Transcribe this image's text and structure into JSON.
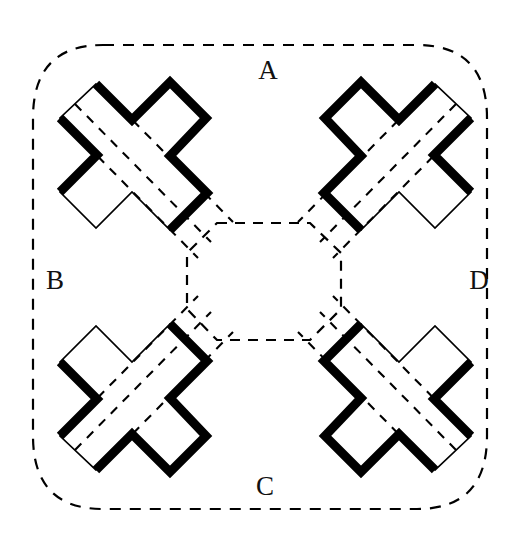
{
  "figure": {
    "background_color": "#ffffff",
    "ink_color": "#000000",
    "thick_stroke_width": 9,
    "thin_stroke_width": 1.6,
    "dashed_stroke_width": 2.0,
    "dash_pattern": "9 8",
    "canvas": {
      "width": 531,
      "height": 554
    }
  },
  "labels": [
    {
      "id": "label-a",
      "text": "A",
      "x": 268,
      "y": 72
    },
    {
      "id": "label-b",
      "text": "B",
      "x": 54,
      "y": 283
    },
    {
      "id": "label-c",
      "text": "C",
      "x": 265,
      "y": 489
    },
    {
      "id": "label-d",
      "text": "D",
      "x": 479,
      "y": 283
    }
  ],
  "geometry": {
    "outer_boundary": {
      "name": "dashed-rounded-square-boundary",
      "path": "M 100 44 L 420 44 Q 487 44 487 116 L 487 438 Q 487 510 420 510 L 100 510 Q 33 510 33 438 L 33 116 Q 33 44 100 44 Z",
      "style": "dashed"
    },
    "center_octagon": {
      "name": "dashed-center-octagon",
      "path": "M 218 222 L 310 222 L 340 252 L 340 310 L 310 340 L 218 340 L 188 310 L 188 252 Z",
      "style": "dashed"
    },
    "cross_outline_base": "M 94 82 L 130 118 L 168 80 L 204 116 L 168 154 L 204 190 L 168 228 L 130 192 L 94 228 L 58 192 L 94 154 L 58 118 Z",
    "crosses": [
      {
        "id": "cross-top-left",
        "cx": 141,
        "cy": 168,
        "rotation": 0,
        "thick_edges": "upper-right"
      },
      {
        "id": "cross-top-right",
        "cx": 390,
        "cy": 168,
        "rotation": 90,
        "thick_edges": "upper-left"
      },
      {
        "id": "cross-bottom-left",
        "cx": 141,
        "cy": 392,
        "rotation": 270,
        "thick_edges": "lower-right"
      },
      {
        "id": "cross-bottom-right",
        "cx": 390,
        "cy": 392,
        "rotation": 180,
        "thick_edges": "lower-left"
      }
    ],
    "diagonal_bands": [
      {
        "id": "band-top-left",
        "direction": "down-right",
        "dash_lines": 3
      },
      {
        "id": "band-top-right",
        "direction": "down-left",
        "dash_lines": 3
      },
      {
        "id": "band-bottom-left",
        "direction": "up-right",
        "dash_lines": 3
      },
      {
        "id": "band-bottom-right",
        "direction": "up-left",
        "dash_lines": 3
      }
    ]
  }
}
